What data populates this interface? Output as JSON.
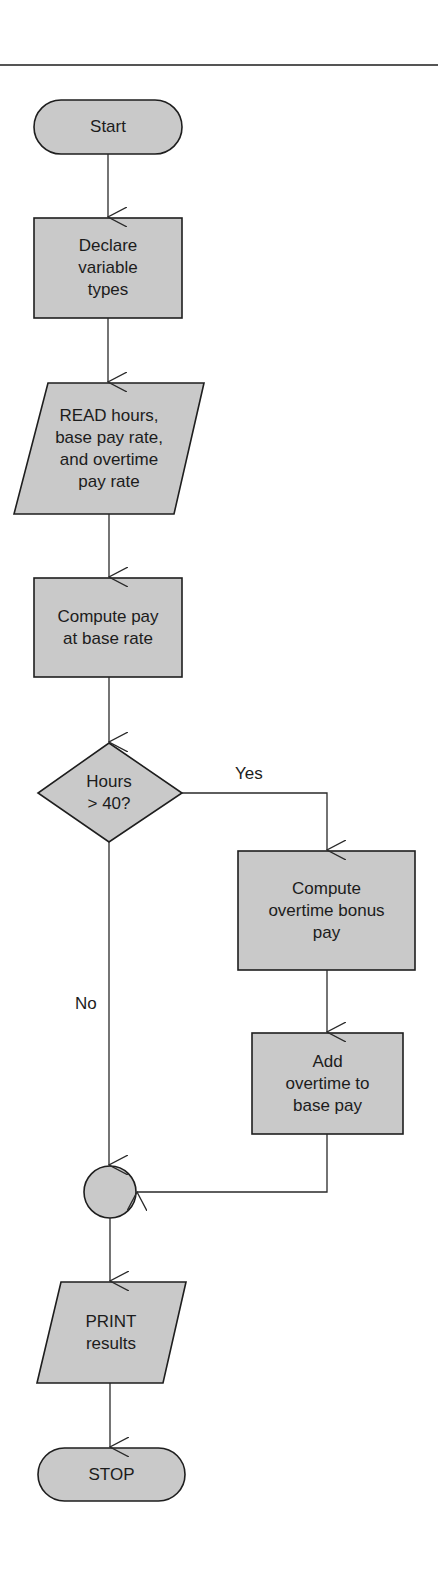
{
  "diagram": {
    "type": "flowchart",
    "nodes": {
      "start": {
        "shape": "terminal",
        "text": "Start"
      },
      "declare": {
        "shape": "process",
        "text": "Declare\nvariable\ntypes"
      },
      "read": {
        "shape": "input-output",
        "text": "READ hours,\nbase pay rate,\nand overtime\npay rate"
      },
      "compute_base": {
        "shape": "process",
        "text": "Compute pay\nat base rate"
      },
      "decision": {
        "shape": "decision",
        "text": "Hours\n>  40?"
      },
      "compute_overtime": {
        "shape": "process",
        "text": "Compute\novertime bonus\npay"
      },
      "add_overtime": {
        "shape": "process",
        "text": "Add\novertime to\nbase pay"
      },
      "connector": {
        "shape": "connector",
        "text": ""
      },
      "print": {
        "shape": "input-output",
        "text": "PRINT\nresults"
      },
      "stop": {
        "shape": "terminal",
        "text": "STOP"
      }
    },
    "edges": [
      {
        "from": "start",
        "to": "declare",
        "label": ""
      },
      {
        "from": "declare",
        "to": "read",
        "label": ""
      },
      {
        "from": "read",
        "to": "compute_base",
        "label": ""
      },
      {
        "from": "compute_base",
        "to": "decision",
        "label": ""
      },
      {
        "from": "decision",
        "to": "compute_overtime",
        "label": "Yes"
      },
      {
        "from": "compute_overtime",
        "to": "add_overtime",
        "label": ""
      },
      {
        "from": "add_overtime",
        "to": "connector",
        "label": ""
      },
      {
        "from": "decision",
        "to": "connector",
        "label": "No"
      },
      {
        "from": "connector",
        "to": "print",
        "label": ""
      },
      {
        "from": "print",
        "to": "stop",
        "label": ""
      }
    ],
    "labels": {
      "yes": "Yes",
      "no": "No"
    },
    "colors": {
      "fill": "#c9c9c9",
      "stroke": "#1e1e1e",
      "background": "#ffffff"
    }
  }
}
